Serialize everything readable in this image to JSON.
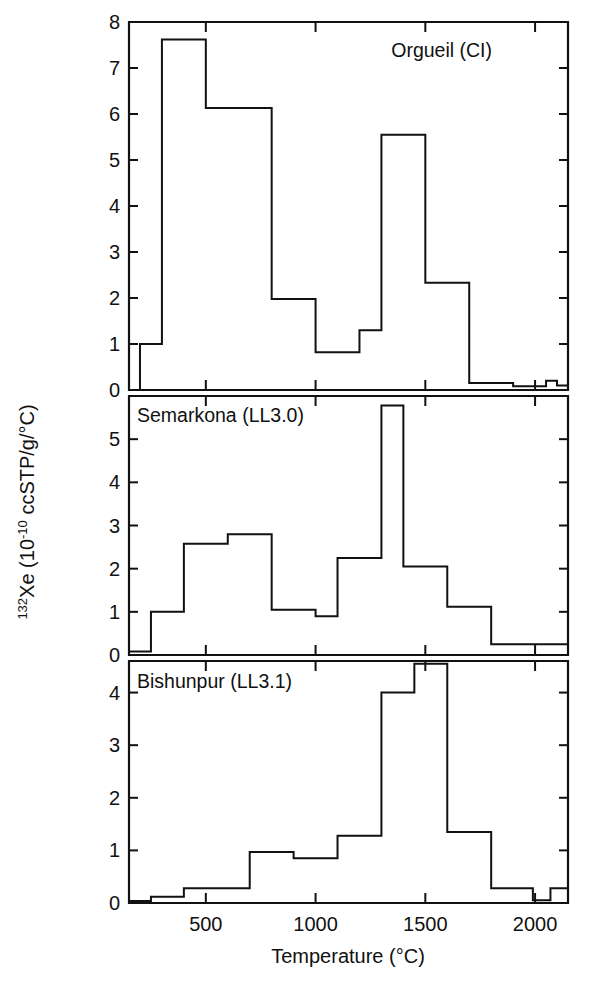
{
  "figure": {
    "axis_titles": {
      "x": "Temperature (°C)",
      "y_isotope_sup": "132",
      "y_main_a": "Xe (10",
      "y_exp_sup": "-10",
      "y_main_b": " ccSTP/g/°C)",
      "y_full": "132Xe (10-10 ccSTP/g/°C)"
    },
    "x_ticks": [
      "500",
      "1000",
      "1500",
      "2000"
    ],
    "x_tick_values": [
      500,
      1000,
      1500,
      2000
    ],
    "x_minor_ticks": [
      250,
      750,
      1250,
      1750
    ],
    "xlim": [
      150,
      2150
    ]
  },
  "chart_data": [
    {
      "type": "line",
      "panel": "top",
      "title": "Orgueil (CI)",
      "xlabel": "Temperature (°C)",
      "ylabel": "132Xe (10-10 ccSTP/g/°C)",
      "xlim": [
        150,
        2150
      ],
      "ylim": [
        0,
        8
      ],
      "y_ticks": [
        "0",
        "1",
        "2",
        "3",
        "4",
        "5",
        "6",
        "7",
        "8"
      ],
      "y_tick_values": [
        0,
        1,
        2,
        3,
        4,
        5,
        6,
        7,
        8
      ],
      "grid": false,
      "legend": "none",
      "step_edges": [
        150,
        200,
        300,
        400,
        500,
        600,
        700,
        800,
        900,
        1000,
        1100,
        1200,
        1300,
        1400,
        1500,
        1600,
        1700,
        1800,
        1900,
        2000,
        2050,
        2100,
        2150
      ],
      "step_values": [
        0.0,
        0.0,
        1.0,
        7.62,
        7.62,
        6.13,
        6.13,
        6.13,
        1.98,
        1.98,
        0.82,
        0.82,
        1.3,
        1.3,
        5.55,
        5.55,
        2.33,
        2.33,
        0.15,
        0.08,
        0.08,
        0.2,
        0.1
      ],
      "bins": [
        {
          "t_start": 150,
          "t_end": 200,
          "value": 0.0
        },
        {
          "t_start": 200,
          "t_end": 300,
          "value": 1.0
        },
        {
          "t_start": 300,
          "t_end": 500,
          "value": 7.62
        },
        {
          "t_start": 500,
          "t_end": 800,
          "value": 6.13
        },
        {
          "t_start": 800,
          "t_end": 1000,
          "value": 1.98
        },
        {
          "t_start": 1000,
          "t_end": 1200,
          "value": 0.82
        },
        {
          "t_start": 1200,
          "t_end": 1300,
          "value": 1.3
        },
        {
          "t_start": 1300,
          "t_end": 1500,
          "value": 5.55
        },
        {
          "t_start": 1500,
          "t_end": 1700,
          "value": 2.33
        },
        {
          "t_start": 1700,
          "t_end": 1900,
          "value": 0.15
        },
        {
          "t_start": 1900,
          "t_end": 2050,
          "value": 0.08
        },
        {
          "t_start": 2050,
          "t_end": 2100,
          "value": 0.2
        },
        {
          "t_start": 2100,
          "t_end": 2150,
          "value": 0.1
        }
      ]
    },
    {
      "type": "line",
      "panel": "middle",
      "title": "Semarkona (LL3.0)",
      "xlabel": "Temperature (°C)",
      "ylabel": "132Xe (10-10 ccSTP/g/°C)",
      "xlim": [
        150,
        2150
      ],
      "ylim": [
        0,
        6
      ],
      "y_ticks": [
        "0",
        "1",
        "2",
        "3",
        "4",
        "5"
      ],
      "y_tick_values": [
        0,
        1,
        2,
        3,
        4,
        5
      ],
      "grid": false,
      "legend": "none",
      "bins": [
        {
          "t_start": 150,
          "t_end": 250,
          "value": 0.08
        },
        {
          "t_start": 250,
          "t_end": 400,
          "value": 1.0
        },
        {
          "t_start": 400,
          "t_end": 600,
          "value": 2.58
        },
        {
          "t_start": 600,
          "t_end": 800,
          "value": 2.8
        },
        {
          "t_start": 800,
          "t_end": 1000,
          "value": 1.05
        },
        {
          "t_start": 1000,
          "t_end": 1100,
          "value": 0.9
        },
        {
          "t_start": 1100,
          "t_end": 1300,
          "value": 2.25
        },
        {
          "t_start": 1300,
          "t_end": 1400,
          "value": 5.78
        },
        {
          "t_start": 1400,
          "t_end": 1600,
          "value": 2.05
        },
        {
          "t_start": 1600,
          "t_end": 1800,
          "value": 1.12
        },
        {
          "t_start": 1800,
          "t_end": 1950,
          "value": 0.25
        },
        {
          "t_start": 1950,
          "t_end": 2150,
          "value": 0.25
        }
      ]
    },
    {
      "type": "line",
      "panel": "bottom",
      "title": "Bishunpur (LL3.1)",
      "xlabel": "Temperature (°C)",
      "ylabel": "132Xe (10-10 ccSTP/g/°C)",
      "xlim": [
        150,
        2150
      ],
      "ylim": [
        0,
        4.6
      ],
      "y_ticks": [
        "0",
        "1",
        "2",
        "3",
        "4"
      ],
      "y_tick_values": [
        0,
        1,
        2,
        3,
        4
      ],
      "grid": false,
      "legend": "none",
      "bins": [
        {
          "t_start": 150,
          "t_end": 250,
          "value": 0.04
        },
        {
          "t_start": 250,
          "t_end": 400,
          "value": 0.12
        },
        {
          "t_start": 400,
          "t_end": 700,
          "value": 0.28
        },
        {
          "t_start": 700,
          "t_end": 900,
          "value": 0.97
        },
        {
          "t_start": 900,
          "t_end": 1100,
          "value": 0.85
        },
        {
          "t_start": 1100,
          "t_end": 1300,
          "value": 1.28
        },
        {
          "t_start": 1300,
          "t_end": 1450,
          "value": 4.0
        },
        {
          "t_start": 1450,
          "t_end": 1600,
          "value": 4.55
        },
        {
          "t_start": 1600,
          "t_end": 1800,
          "value": 1.35
        },
        {
          "t_start": 1800,
          "t_end": 1990,
          "value": 0.28
        },
        {
          "t_start": 1990,
          "t_end": 2070,
          "value": 0.05
        },
        {
          "t_start": 2070,
          "t_end": 2150,
          "value": 0.28
        }
      ]
    }
  ]
}
